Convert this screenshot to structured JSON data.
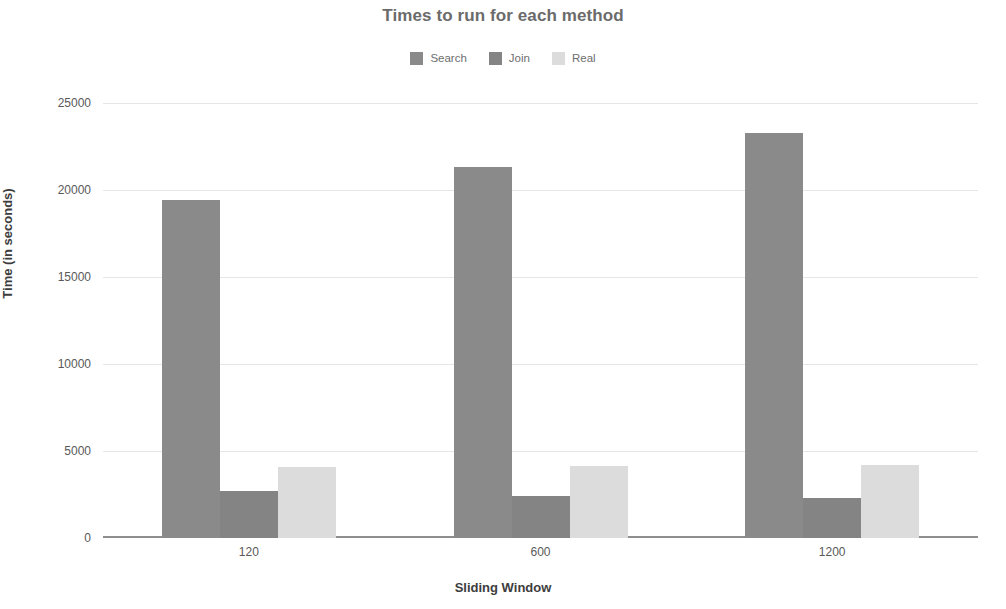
{
  "chart_data": {
    "type": "bar",
    "title": "Times to run for each method",
    "xlabel": "Sliding Window",
    "ylabel": "Time (in seconds)",
    "categories": [
      "120",
      "600",
      "1200"
    ],
    "series": [
      {
        "name": "Search",
        "color": "#8a8a8a",
        "values": [
          19400,
          21300,
          23300
        ]
      },
      {
        "name": "Join",
        "color": "#848484",
        "values": [
          2700,
          2400,
          2300
        ]
      },
      {
        "name": "Real",
        "color": "#dcdcdc",
        "values": [
          4100,
          4150,
          4200
        ]
      }
    ],
    "ylim": [
      0,
      25000
    ],
    "yticks": [
      0,
      5000,
      10000,
      15000,
      20000,
      25000
    ],
    "ytick_labels": [
      "0",
      "5000",
      "10000",
      "15000",
      "20000",
      "25000"
    ],
    "grid": true,
    "legend_position": "top-center",
    "background": "#ffffff",
    "grid_color": "#e6e6e6",
    "axis_color": "#8e8e8e"
  }
}
